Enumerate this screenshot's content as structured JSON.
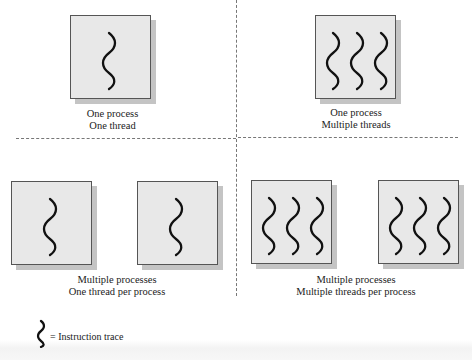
{
  "diagram": {
    "quadrants": [
      {
        "id": "top-left",
        "caption_line1": "One process",
        "caption_line2": "One thread",
        "processes": 1,
        "threads_per_process": 1
      },
      {
        "id": "top-right",
        "caption_line1": "One process",
        "caption_line2": "Multiple threads",
        "processes": 1,
        "threads_per_process": 3
      },
      {
        "id": "bottom-left",
        "caption_line1": "Multiple processes",
        "caption_line2": "One thread per process",
        "processes": 2,
        "threads_per_process": 1
      },
      {
        "id": "bottom-right",
        "caption_line1": "Multiple processes",
        "caption_line2": "Multiple threads per process",
        "processes": 2,
        "threads_per_process": 3
      }
    ],
    "legend": {
      "symbol": "wavy-line",
      "label": "= Instruction trace"
    },
    "colors": {
      "box_fill": "#e8e8e8",
      "box_border": "#555555",
      "shadow": "#c4c4c4",
      "trace": "#111111",
      "divider": "#777777"
    }
  }
}
